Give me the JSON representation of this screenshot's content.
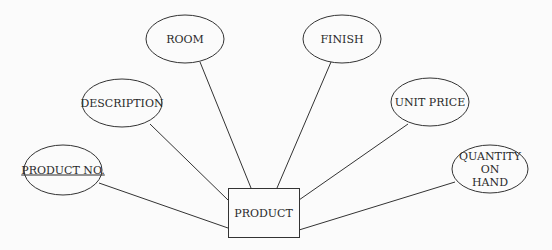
{
  "diagram": {
    "type": "er-entity-attributes",
    "colors": {
      "stroke": "#333333",
      "text": "#2a2a2a",
      "background": "#fbfbfb"
    },
    "entity": {
      "label": "PRODUCT",
      "x": 228,
      "y": 188,
      "width": 71,
      "height": 49
    },
    "attributes": [
      {
        "id": "product-no",
        "label": "PRODUCT NO.",
        "is_key": true,
        "cx": 63,
        "cy": 170,
        "rx": 39,
        "ry": 25,
        "line": [
          99,
          183,
          228,
          228
        ]
      },
      {
        "id": "description",
        "label": "DESCRIPTION",
        "is_key": false,
        "cx": 122,
        "cy": 103,
        "rx": 40,
        "ry": 24,
        "line": [
          150,
          124,
          228,
          200
        ]
      },
      {
        "id": "room",
        "label": "ROOM",
        "is_key": false,
        "cx": 185,
        "cy": 39,
        "rx": 39,
        "ry": 24,
        "line": [
          200,
          62,
          251,
          188
        ]
      },
      {
        "id": "finish",
        "label": "FINISH",
        "is_key": false,
        "cx": 342,
        "cy": 39,
        "rx": 39,
        "ry": 24,
        "line": [
          331,
          62,
          277,
          188
        ]
      },
      {
        "id": "unit-price",
        "label": "UNIT PRICE",
        "is_key": false,
        "cx": 430,
        "cy": 102,
        "rx": 39,
        "ry": 24,
        "line": [
          408,
          124,
          299,
          200
        ]
      },
      {
        "id": "quantity-on-hand",
        "label": "QUANTITY ON\nHAND",
        "is_key": false,
        "cx": 490,
        "cy": 169,
        "rx": 38,
        "ry": 24,
        "line": [
          455,
          182,
          299,
          230
        ]
      }
    ]
  }
}
